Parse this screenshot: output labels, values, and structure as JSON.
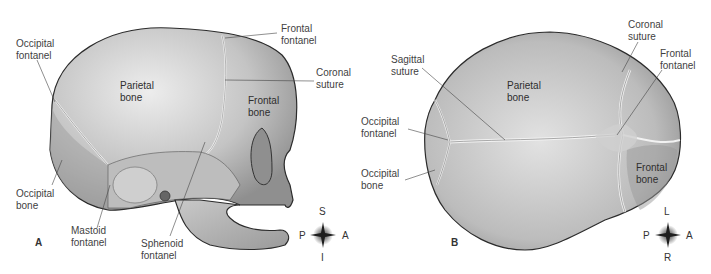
{
  "figure": {
    "colors": {
      "bone_light": "#d8d8d8",
      "bone_mid": "#b3b3b3",
      "bone_dark": "#8a8a8a",
      "outline": "#2b2b2b",
      "leader_line": "#444444",
      "label_text": "#3f3f3f"
    }
  },
  "panel_a": {
    "letter": "A",
    "view": "lateral",
    "labels": {
      "occipital_fontanel": "Occipital\nfontanel",
      "frontal_fontanel": "Frontal\nfontanel",
      "coronal_suture": "Coronal\nsuture",
      "parietal_bone": "Parietal\nbone",
      "frontal_bone": "Frontal\nbone",
      "occipital_bone": "Occipital\nbone",
      "mastoid_fontanel": "Mastoid\nfontanel",
      "sphenoid_fontanel": "Sphenoid\nfontanel"
    },
    "compass": {
      "top": "S",
      "bottom": "I",
      "left": "P",
      "right": "A"
    }
  },
  "panel_b": {
    "letter": "B",
    "view": "superior",
    "labels": {
      "coronal_suture": "Coronal\nsuture",
      "sagittal_suture": "Sagittal\nsuture",
      "frontal_fontanel": "Frontal\nfontanel",
      "parietal_bone": "Parietal\nbone",
      "occipital_fontanel": "Occipital\nfontanel",
      "occipital_bone": "Occipital\nbone",
      "frontal_bone": "Frontal\nbone"
    },
    "compass": {
      "top": "L",
      "bottom": "R",
      "left": "P",
      "right": "A"
    }
  }
}
